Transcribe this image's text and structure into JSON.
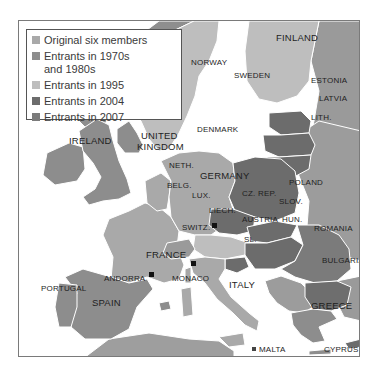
{
  "legend": {
    "items": [
      {
        "label": "Original six members",
        "color": "#a9a9a9"
      },
      {
        "label": "Entrants in 1970s and 1980s",
        "color": "#8d8d8d"
      },
      {
        "label": "Entrants in 1995",
        "color": "#bebebe"
      },
      {
        "label": "Entrants in 2004",
        "color": "#6c6c6c"
      },
      {
        "label": "Entrants in 2007",
        "color": "#7b7b7b"
      }
    ]
  },
  "colors": {
    "original_six": "#a9a9a9",
    "entrants_1970s_1980s": "#8d8d8d",
    "entrants_1995": "#bebebe",
    "entrants_2004": "#6c6c6c",
    "entrants_2007": "#7b7b7b",
    "non_member": "#9a9a9a",
    "sea": "#ffffff",
    "border": "#ffffff"
  },
  "labels": {
    "finland": "FINLAND",
    "norway": "NORWAY",
    "sweden": "SWEDEN",
    "estonia": "ESTONIA",
    "latvia": "LATVIA",
    "lithuania": "LITH.",
    "denmark": "DENMARK",
    "ireland": "IRELAND",
    "united_kingdom_1": "UNITED",
    "united_kingdom_2": "KINGDOM",
    "netherlands": "NETH.",
    "germany": "GERMANY",
    "poland": "POLAND",
    "belgium": "BELG.",
    "luxembourg": "LUX.",
    "czech_republic": "CZ. REP.",
    "slovakia": "SLOV.",
    "liechtenstein": "LIECH.",
    "switzerland": "SWITZ.",
    "austria": "AUSTRIA",
    "hungary": "HUN.",
    "romania": "ROMANIA",
    "france": "FRANCE",
    "slovenia": "SL.",
    "bulgaria": "BULGARIA",
    "andorra": "ANDORRA",
    "monaco": "MONACO",
    "portugal": "PORTUGAL",
    "spain": "SPAIN",
    "italy": "ITALY",
    "greece": "GREECE",
    "malta": "MALTA",
    "cyprus": "CYPRUS"
  }
}
